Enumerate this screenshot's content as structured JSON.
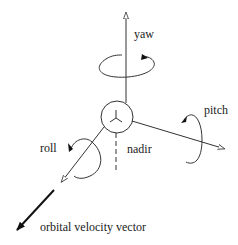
{
  "diagram": {
    "type": "spacecraft attitude axes",
    "labels": {
      "yaw": "yaw",
      "pitch": "pitch",
      "roll": "roll",
      "nadir": "nadir",
      "velocity": "orbital velocity vector"
    },
    "colors": {
      "stroke": "#333333",
      "text": "#1a1a1a",
      "background": "#ffffff"
    }
  }
}
